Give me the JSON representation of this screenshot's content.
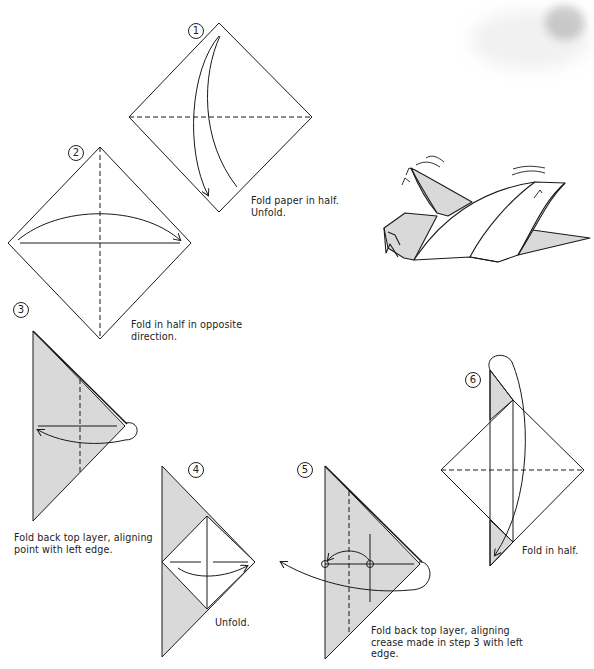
{
  "document": {
    "type": "origami-instructions",
    "colors": {
      "paper_fill": "#d9d9d9",
      "line": "#1a1a1a",
      "background": "#ffffff"
    }
  },
  "steps": [
    {
      "number": "1",
      "caption_lines": [
        "Fold paper in half.",
        "Unfold."
      ]
    },
    {
      "number": "2",
      "caption_lines": [
        "Fold in half in opposite",
        "direction."
      ]
    },
    {
      "number": "3",
      "caption_lines": [
        "Fold back top layer, aligning",
        "point with left edge."
      ]
    },
    {
      "number": "4",
      "caption_lines": [
        "Unfold."
      ]
    },
    {
      "number": "5",
      "caption_lines": [
        "Fold back top layer, aligning",
        "crease made in step 3 with left",
        "edge."
      ]
    },
    {
      "number": "6",
      "caption_lines": [
        "Fold in half."
      ]
    }
  ],
  "final_model": {
    "label": "finished-bird-illustration"
  }
}
